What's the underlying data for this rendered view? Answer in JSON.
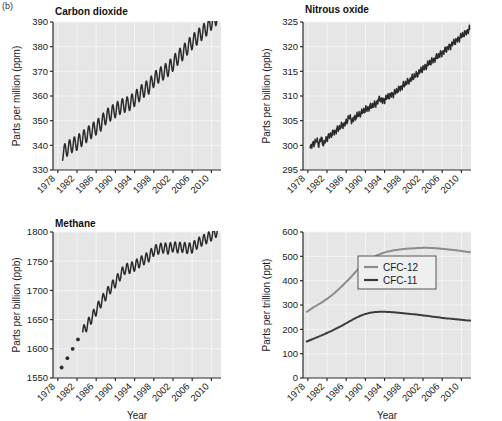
{
  "figure": {
    "label": "(b)",
    "xaxis_title": "Year",
    "xticks": [
      1978,
      1982,
      1986,
      1990,
      1994,
      1998,
      2002,
      2006,
      2010
    ],
    "xlim": [
      1977,
      2012
    ],
    "background": "#e6e6e6",
    "grid_color": "#f4f4f4",
    "line_color": "#2b2b2b"
  },
  "chart_data": [
    {
      "type": "line",
      "id": "carbon-dioxide",
      "title": "Carbon dioxide",
      "ylabel": "Parts per million (ppm)",
      "xlabel": "",
      "ylim": [
        330,
        390
      ],
      "yticks": [
        330,
        340,
        350,
        360,
        370,
        380,
        390
      ],
      "xlim": [
        1977,
        2012
      ],
      "grid": true,
      "seasonal_amplitude": 3.0,
      "series": [
        {
          "name": "CO2",
          "color": "#2b2b2b",
          "x": [
            1979.0,
            1980.0,
            1981.0,
            1982.0,
            1983.0,
            1984.0,
            1985.0,
            1986.0,
            1987.0,
            1988.0,
            1989.0,
            1990.0,
            1991.0,
            1992.0,
            1993.0,
            1994.0,
            1995.0,
            1996.0,
            1997.0,
            1998.0,
            1999.0,
            2000.0,
            2001.0,
            2002.0,
            2003.0,
            2004.0,
            2005.0,
            2006.0,
            2007.0,
            2008.0,
            2009.0,
            2010.0,
            2011.0,
            2011.6
          ],
          "values": [
            336.8,
            338.7,
            340.1,
            341.0,
            342.6,
            344.2,
            345.8,
            347.2,
            348.9,
            351.5,
            352.9,
            354.2,
            355.6,
            356.4,
            357.1,
            358.8,
            360.8,
            362.6,
            363.8,
            366.6,
            368.3,
            369.5,
            371.0,
            373.1,
            375.6,
            377.4,
            379.7,
            381.9,
            383.7,
            385.6,
            387.4,
            389.8,
            391.6,
            392.4
          ]
        }
      ]
    },
    {
      "type": "line",
      "id": "nitrous-oxide",
      "title": "Nitrous oxide",
      "ylabel": "Parts per billion (ppb)",
      "xlabel": "",
      "ylim": [
        295,
        325
      ],
      "yticks": [
        295,
        300,
        305,
        310,
        315,
        320,
        325
      ],
      "xlim": [
        1977,
        2012
      ],
      "grid": true,
      "noise_amplitude": 0.45,
      "series": [
        {
          "name": "N2O",
          "color": "#2b2b2b",
          "x": [
            1978.5,
            1979.2,
            1979.8,
            1980.3,
            1980.8,
            1981.3,
            1982.0,
            1983.0,
            1984.0,
            1985.0,
            1986.0,
            1986.6,
            1987.2,
            1988.0,
            1989.0,
            1990.0,
            1991.0,
            1992.0,
            1993.0,
            1993.6,
            1994.3,
            1995.0,
            1996.0,
            1997.0,
            1998.0,
            1999.0,
            2000.0,
            2001.0,
            2002.0,
            2003.0,
            2004.0,
            2005.0,
            2006.0,
            2007.0,
            2008.0,
            2009.0,
            2010.0,
            2011.0,
            2011.7
          ],
          "values": [
            299.7,
            300.3,
            301.0,
            300.2,
            301.4,
            300.1,
            301.6,
            302.3,
            303.1,
            303.9,
            304.6,
            305.8,
            305.0,
            305.8,
            306.5,
            307.2,
            307.8,
            308.3,
            309.5,
            308.9,
            309.6,
            310.0,
            310.6,
            311.4,
            312.2,
            313.0,
            313.8,
            314.6,
            315.5,
            316.4,
            317.2,
            318.0,
            318.8,
            319.6,
            320.5,
            321.3,
            322.1,
            322.9,
            323.5
          ]
        }
      ]
    },
    {
      "type": "line",
      "id": "methane",
      "title": "Methane",
      "ylabel": "Parts per billion (ppb)",
      "xlabel": "Year",
      "ylim": [
        1550,
        1800
      ],
      "yticks": [
        1550,
        1600,
        1650,
        1700,
        1750,
        1800
      ],
      "xlim": [
        1977,
        2012
      ],
      "grid": true,
      "seasonal_amplitude": 9.0,
      "early_points": {
        "name": "Early discrete samples",
        "x": [
          1978.8,
          1980.0,
          1981.1,
          1982.2
        ],
        "values": [
          1568,
          1584,
          1600,
          1616
        ]
      },
      "series": [
        {
          "name": "CH4",
          "color": "#2b2b2b",
          "x": [
            1983.2,
            1984.0,
            1985.0,
            1986.0,
            1987.0,
            1988.0,
            1989.0,
            1990.0,
            1991.0,
            1992.0,
            1993.0,
            1994.0,
            1995.0,
            1996.0,
            1997.0,
            1998.0,
            1999.0,
            2000.0,
            2001.0,
            2002.0,
            2003.0,
            2004.0,
            2005.0,
            2006.0,
            2007.0,
            2008.0,
            2009.0,
            2010.0,
            2011.0,
            2011.7
          ],
          "values": [
            1629,
            1639,
            1652,
            1666,
            1680,
            1692,
            1704,
            1714,
            1726,
            1737,
            1738,
            1742,
            1748,
            1753,
            1758,
            1768,
            1771,
            1773,
            1771,
            1775,
            1773,
            1774,
            1772,
            1773,
            1780,
            1785,
            1789,
            1794,
            1800,
            1803
          ]
        }
      ]
    },
    {
      "type": "line",
      "id": "cfcs",
      "title": "",
      "ylabel": "Parts per trillion (ppt)",
      "xlabel": "Year",
      "ylim": [
        0,
        600
      ],
      "yticks": [
        0,
        100,
        200,
        300,
        400,
        500,
        600
      ],
      "xlim": [
        1977,
        2012
      ],
      "grid": true,
      "legend_position": "center-right",
      "series": [
        {
          "name": "CFC-12",
          "color": "#8c8c8c",
          "x": [
            1977.8,
            1979,
            1980,
            1981,
            1982,
            1983,
            1984,
            1985,
            1986,
            1987,
            1988,
            1989,
            1990,
            1991,
            1992,
            1993,
            1994,
            1995,
            1996,
            1997,
            1998,
            1999,
            2000,
            2001,
            2002,
            2003,
            2004,
            2005,
            2006,
            2007,
            2008,
            2009,
            2010,
            2011,
            2011.8
          ],
          "values": [
            272,
            288,
            300,
            312,
            325,
            340,
            357,
            375,
            395,
            415,
            437,
            458,
            475,
            489,
            500,
            509,
            516,
            521,
            525,
            528,
            530,
            532,
            533,
            534,
            535,
            535,
            534,
            533,
            531,
            529,
            527,
            525,
            522,
            519,
            517
          ]
        },
        {
          "name": "CFC-11",
          "color": "#3c3c3c",
          "x": [
            1977.8,
            1979,
            1980,
            1981,
            1982,
            1983,
            1984,
            1985,
            1986,
            1987,
            1988,
            1989,
            1990,
            1991,
            1992,
            1993,
            1994,
            1995,
            1996,
            1997,
            1998,
            1999,
            2000,
            2001,
            2002,
            2003,
            2004,
            2005,
            2006,
            2007,
            2008,
            2009,
            2010,
            2011,
            2011.8
          ],
          "values": [
            150,
            160,
            168,
            176,
            185,
            194,
            204,
            214,
            225,
            236,
            247,
            256,
            263,
            268,
            271,
            272,
            272,
            271,
            270,
            268,
            266,
            264,
            262,
            260,
            257,
            255,
            252,
            250,
            247,
            245,
            243,
            241,
            239,
            237,
            236
          ]
        }
      ]
    }
  ]
}
